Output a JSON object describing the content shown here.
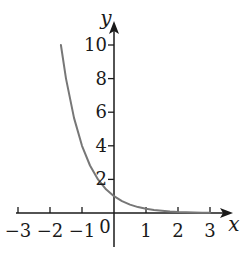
{
  "chart_data": {
    "type": "line",
    "title": "",
    "xlabel": "x",
    "ylabel": "y",
    "function": "y = (1/4)^x",
    "xlim": [
      -3,
      3
    ],
    "ylim": [
      0,
      10
    ],
    "x_ticks": [
      -3,
      -2,
      -1,
      0,
      1,
      2,
      3
    ],
    "x_tick_labels": [
      "−3",
      "−2",
      "−1",
      "0",
      "1",
      "2",
      "3"
    ],
    "y_ticks": [
      2,
      4,
      6,
      8,
      10
    ],
    "y_tick_labels": [
      "2",
      "4",
      "6",
      "8",
      "10"
    ],
    "grid": false,
    "legend": null,
    "series": [
      {
        "name": "exponential decay",
        "color": "#777777",
        "x": [
          -1.66,
          -1.5,
          -1.25,
          -1,
          -0.75,
          -0.5,
          -0.25,
          0,
          0.25,
          0.5,
          0.75,
          1,
          1.25,
          1.5,
          1.75,
          2,
          2.25,
          2.5,
          2.75,
          3
        ],
        "y": [
          10.0,
          8.0,
          5.66,
          4.0,
          2.83,
          2.0,
          1.41,
          1.0,
          0.71,
          0.5,
          0.35,
          0.25,
          0.18,
          0.13,
          0.09,
          0.06,
          0.04,
          0.03,
          0.02,
          0.016
        ]
      }
    ]
  },
  "axes": {
    "x_name": "x",
    "y_name": "y",
    "origin_label": "0"
  },
  "colors": {
    "axis": "#1a1a1a",
    "curve": "#777777"
  }
}
